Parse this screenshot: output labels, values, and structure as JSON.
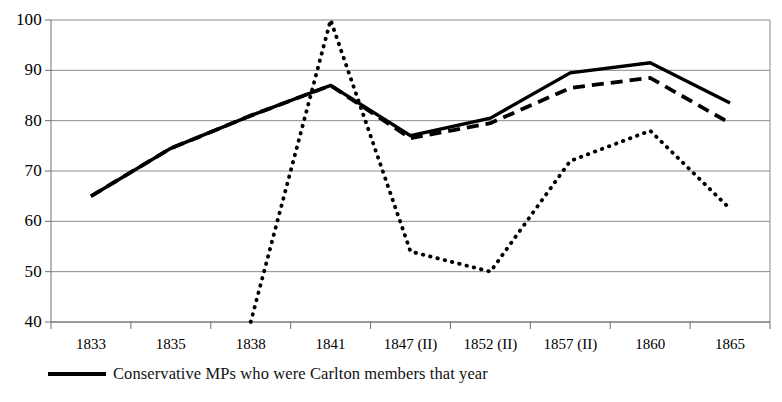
{
  "chart_data": {
    "type": "line",
    "title": "",
    "xlabel": "",
    "ylabel": "",
    "categories": [
      "1833",
      "1835",
      "1838",
      "1841",
      "1847 (II)",
      "1852 (II)",
      "1857 (II)",
      "1860",
      "1865"
    ],
    "ylim": [
      40,
      100
    ],
    "yticks": [
      40,
      50,
      60,
      70,
      80,
      90,
      100
    ],
    "ytick_labels": [
      "40",
      "50",
      "60",
      "70",
      "80",
      "90",
      "100"
    ],
    "grid": true,
    "grid_axis": "y",
    "legend_position": "bottom-left",
    "series": [
      {
        "name": "Conservative MPs who were Carlton members that year",
        "style": "solid",
        "color": "#000000",
        "values": [
          65,
          74.5,
          81,
          87,
          77,
          80.5,
          89.5,
          91.5,
          83.5
        ]
      },
      {
        "name": "",
        "style": "dashed",
        "color": "#000000",
        "values": [
          65,
          74.5,
          81,
          87,
          76.5,
          79.5,
          86.5,
          88.5,
          79.5
        ]
      },
      {
        "name": "",
        "style": "dotted",
        "color": "#000000",
        "values": [
          null,
          null,
          40,
          100,
          54,
          50,
          72,
          78,
          62.5
        ]
      }
    ],
    "annotations": []
  },
  "legend": {
    "entries": [
      {
        "label": "Conservative MPs who were Carlton members that year",
        "style": "solid"
      }
    ]
  },
  "colors": {
    "ink": "#000000",
    "gridline": "#8a8a8a",
    "axis": "#6e6e6e",
    "background": "#ffffff"
  }
}
